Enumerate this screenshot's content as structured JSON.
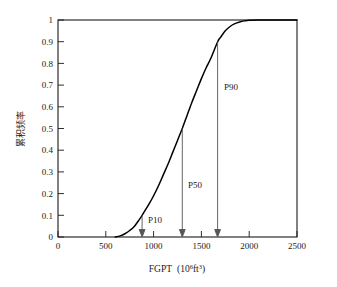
{
  "chart_data": {
    "type": "line",
    "title": "",
    "subtitle": "",
    "xlabel": "FGPT",
    "xlabel_unit_base": "(10",
    "xlabel_unit_exp": "6",
    "xlabel_unit_mid": "ft",
    "xlabel_unit_exp2": "3",
    "xlabel_unit_close": ")",
    "xlabel_full": "FGPT (10⁶ft³)",
    "ylabel": "累积频率",
    "xlim": [
      0,
      2500
    ],
    "ylim": [
      0,
      1
    ],
    "grid": false,
    "legend": false,
    "legend_position": "none",
    "xticks": [
      "0",
      "500",
      "1000",
      "1500",
      "2000",
      "2500"
    ],
    "xtick_values": [
      0,
      500,
      1000,
      1500,
      2000,
      2500
    ],
    "yticks": [
      "0",
      "0.1",
      "0.2",
      "0.3",
      "0.4",
      "0.5",
      "0.6",
      "0.7",
      "0.8",
      "0.9",
      "1"
    ],
    "ytick_values": [
      0,
      0.1,
      0.2,
      0.3,
      0.4,
      0.5,
      0.6,
      0.7,
      0.8,
      0.9,
      1.0
    ],
    "series": [
      {
        "name": "cumulative frequency",
        "color": "#000000",
        "x": [
          600,
          650,
          700,
          750,
          800,
          850,
          880,
          900,
          950,
          1000,
          1050,
          1100,
          1150,
          1200,
          1250,
          1300,
          1350,
          1400,
          1450,
          1500,
          1550,
          1600,
          1670,
          1700,
          1750,
          1800,
          1850,
          1900,
          1950,
          2000,
          2100,
          2200,
          2500
        ],
        "y": [
          0.0,
          0.005,
          0.015,
          0.03,
          0.05,
          0.08,
          0.1,
          0.115,
          0.15,
          0.19,
          0.235,
          0.285,
          0.335,
          0.39,
          0.445,
          0.5,
          0.56,
          0.62,
          0.675,
          0.73,
          0.78,
          0.825,
          0.9,
          0.92,
          0.95,
          0.97,
          0.983,
          0.991,
          0.996,
          0.999,
          1.0,
          1.0,
          1.0
        ]
      }
    ],
    "annotations": [
      {
        "label": "P10",
        "x": 880,
        "y": 0.1,
        "label_x": 950,
        "label_y": 0.055
      },
      {
        "label": "P50",
        "x": 1300,
        "y": 0.5,
        "label_x": 1375,
        "label_y": 0.255
      },
      {
        "label": "P90",
        "x": 1670,
        "y": 0.9,
        "label_x": 1745,
        "label_y": 0.715
      }
    ]
  },
  "colors": {
    "curve": "#000000",
    "axis": "#1a1a1a",
    "annotation_arrow": "#555555",
    "background": "#ffffff"
  }
}
